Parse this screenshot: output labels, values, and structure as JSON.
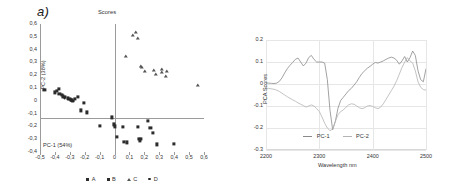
{
  "figure": {
    "panels": [
      {
        "label": "a)"
      },
      {
        "label": "b)"
      }
    ]
  },
  "chart_data": [
    {
      "type": "scatter",
      "panel": "a)",
      "title": "Scores",
      "xlabel": "PC-1 (54%)",
      "ylabel": "PC-2 (38%)",
      "xlim": [
        -0.5,
        0.6
      ],
      "ylim": [
        -0.4,
        0.6
      ],
      "xticks": [
        "-0,5",
        "-0,4",
        "-0,3",
        "-0,2",
        "-0,1",
        "0",
        "0,1",
        "0,2",
        "0,3",
        "0,4",
        "0,5",
        "0,6"
      ],
      "yticks": [
        "0,6",
        "0,5",
        "0,4",
        "0,3",
        "0,2",
        "0,1",
        "0",
        "-0,1",
        "-0,2",
        "-0,3",
        "-0,4"
      ],
      "grid": false,
      "legend_position": "bottom",
      "legend": [
        "A",
        "B",
        "C",
        "D"
      ],
      "series": [
        {
          "name": "A",
          "marker": "square",
          "points": [
            [
              -0.47,
              0.085
            ],
            [
              -0.4,
              0.065
            ],
            [
              -0.385,
              0.075
            ],
            [
              -0.375,
              0.095
            ],
            [
              -0.37,
              0.055
            ],
            [
              -0.355,
              0.045
            ],
            [
              -0.345,
              0.035
            ],
            [
              -0.335,
              0.03
            ],
            [
              -0.315,
              0.02
            ],
            [
              -0.3,
              0.015
            ],
            [
              -0.29,
              0.01
            ],
            [
              -0.285,
              0.008
            ],
            [
              -0.265,
              0.012
            ],
            [
              -0.245,
              0.03
            ],
            [
              -0.205,
              -0.018
            ]
          ]
        },
        {
          "name": "B",
          "marker": "square",
          "points": [
            [
              -0.225,
              -0.075
            ],
            [
              -0.185,
              -0.09
            ],
            [
              -0.1,
              -0.195
            ],
            [
              -0.015,
              -0.13
            ],
            [
              -0.005,
              -0.185
            ],
            [
              0.0,
              -0.2
            ],
            [
              0.015,
              -0.285
            ],
            [
              0.055,
              -0.205
            ],
            [
              0.065,
              -0.32
            ],
            [
              0.085,
              -0.325
            ],
            [
              0.155,
              -0.205
            ],
            [
              0.165,
              -0.295
            ],
            [
              0.17,
              -0.315
            ],
            [
              0.175,
              -0.3
            ],
            [
              0.225,
              -0.155
            ],
            [
              0.24,
              -0.21
            ],
            [
              0.255,
              -0.25
            ],
            [
              0.285,
              -0.34
            ],
            [
              0.4,
              -0.335
            ]
          ]
        },
        {
          "name": "C",
          "marker": "triangle",
          "points": [
            [
              0.075,
              0.34
            ],
            [
              0.125,
              0.51
            ],
            [
              0.145,
              0.53
            ],
            [
              0.155,
              0.48
            ],
            [
              0.175,
              0.265
            ],
            [
              0.185,
              0.255
            ],
            [
              0.205,
              0.225
            ],
            [
              0.265,
              0.235
            ],
            [
              0.275,
              0.205
            ],
            [
              0.315,
              0.24
            ],
            [
              0.32,
              0.215
            ],
            [
              0.355,
              0.225
            ],
            [
              0.345,
              0.185
            ],
            [
              0.56,
              0.115
            ]
          ]
        },
        {
          "name": "D",
          "marker": "dot",
          "points": [
            [
              -0.335,
              0.022
            ],
            [
              -0.31,
              0.01
            ],
            [
              -0.295,
              0.004
            ],
            [
              -0.285,
              0.0
            ],
            [
              -0.275,
              -0.002
            ]
          ]
        }
      ]
    },
    {
      "type": "line",
      "panel": "b)",
      "title": "",
      "xlabel": "Wavelength nm",
      "ylabel": "PCA Scores",
      "xlim": [
        2200,
        2500
      ],
      "ylim": [
        -0.3,
        0.2
      ],
      "xticks": [
        "2200",
        "2300",
        "2400",
        "2500"
      ],
      "yticks": [
        "0.2",
        "0.1",
        "0",
        "-0.1",
        "-0.2",
        "-0.3"
      ],
      "grid": true,
      "legend_position": "bottom",
      "legend": [
        "PC-1",
        "PC-2"
      ],
      "x": [
        2200,
        2205,
        2210,
        2215,
        2220,
        2225,
        2230,
        2235,
        2240,
        2245,
        2250,
        2255,
        2260,
        2265,
        2270,
        2275,
        2280,
        2285,
        2290,
        2295,
        2300,
        2305,
        2310,
        2315,
        2320,
        2325,
        2330,
        2335,
        2340,
        2345,
        2350,
        2355,
        2360,
        2365,
        2370,
        2375,
        2380,
        2385,
        2390,
        2395,
        2400,
        2405,
        2410,
        2415,
        2420,
        2425,
        2430,
        2435,
        2440,
        2445,
        2450,
        2455,
        2460,
        2465,
        2470,
        2475,
        2480,
        2485,
        2490,
        2495,
        2500
      ],
      "series": [
        {
          "name": "PC-1",
          "color": "#8a8a8a",
          "values": [
            0.005,
            0.004,
            0.003,
            0.002,
            0.004,
            0.012,
            0.028,
            0.05,
            0.07,
            0.085,
            0.098,
            0.112,
            0.118,
            0.1,
            0.082,
            0.095,
            0.12,
            0.13,
            0.112,
            0.1,
            0.1,
            0.1,
            0.095,
            0.02,
            -0.12,
            -0.208,
            -0.17,
            -0.11,
            -0.075,
            -0.06,
            -0.045,
            -0.03,
            -0.02,
            -0.005,
            0.01,
            0.03,
            0.048,
            0.06,
            0.072,
            0.08,
            0.09,
            0.098,
            0.095,
            0.1,
            0.105,
            0.112,
            0.118,
            0.122,
            0.118,
            0.108,
            0.09,
            0.105,
            0.125,
            0.1,
            0.12,
            0.15,
            0.13,
            0.06,
            0.02,
            0.01,
            0.07
          ]
        },
        {
          "name": "PC-2",
          "color": "#b4b4b4",
          "values": [
            -0.018,
            -0.02,
            -0.022,
            -0.024,
            -0.028,
            -0.034,
            -0.042,
            -0.05,
            -0.058,
            -0.065,
            -0.072,
            -0.078,
            -0.086,
            -0.092,
            -0.098,
            -0.105,
            -0.1,
            -0.095,
            -0.1,
            -0.112,
            -0.125,
            -0.15,
            -0.178,
            -0.2,
            -0.212,
            -0.205,
            -0.17,
            -0.14,
            -0.125,
            -0.118,
            -0.105,
            -0.095,
            -0.09,
            -0.092,
            -0.1,
            -0.108,
            -0.112,
            -0.108,
            -0.1,
            -0.098,
            -0.102,
            -0.108,
            -0.112,
            -0.105,
            -0.09,
            -0.07,
            -0.05,
            -0.03,
            -0.01,
            0.015,
            0.045,
            0.075,
            0.1,
            0.12,
            0.105,
            0.095,
            0.06,
            0.01,
            -0.015,
            -0.025,
            -0.028
          ]
        }
      ]
    }
  ]
}
